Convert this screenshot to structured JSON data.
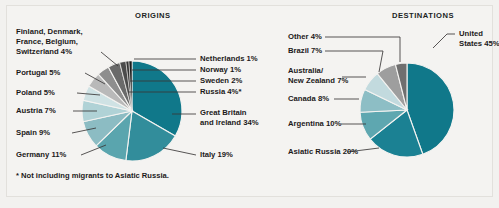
{
  "figure": {
    "background_color": "#f4f3f1",
    "footnote": "* Not including migrants to Asiatic Russia."
  },
  "panels": {
    "origins": {
      "title": "ORIGINS"
    },
    "destinations": {
      "title": "DESTINATIONS"
    }
  },
  "labels": {
    "origins": {
      "finland_group": "Finland, Denmark,",
      "finland_group_2": "France, Belgium,",
      "finland_group_3": "Switzerland  4%",
      "portugal": "Portugal  5%",
      "poland": "Poland  5%",
      "austria": "Austria  7%",
      "spain": "Spain  9%",
      "germany": "Germany  11%",
      "netherlands": "Netherlands  1%",
      "norway": "Norway  1%",
      "sweden": "Sweden  2%",
      "russia": "Russia  4%*",
      "great_britain": "Great Britain",
      "great_britain_2": "and Ireland  34%",
      "italy": "Italy  19%"
    },
    "destinations": {
      "other": "Other  4%",
      "brazil": "Brazil  7%",
      "australia": "Australia/",
      "australia_2": "New Zealand  7%",
      "canada": "Canada  8%",
      "argentina": "Argentina  10%",
      "asiatic_russia": "Asiatic Russia  20%",
      "united_states": "United",
      "united_states_2": "States 45%"
    }
  },
  "chart_data": [
    {
      "type": "pie",
      "title": "ORIGINS",
      "note": "* Not including migrants to Asiatic Russia.",
      "unit": "percent",
      "center": [
        132,
        111
      ],
      "radius": 50,
      "start_angle_deg": -90,
      "direction": "clockwise",
      "slices": [
        {
          "label": "Great Britain and Ireland",
          "value": 34,
          "color": "#10788a",
          "label_text": "Great Britain and Ireland  34%"
        },
        {
          "label": "Italy",
          "value": 19,
          "color": "#328d9b",
          "label_text": "Italy  19%"
        },
        {
          "label": "Germany",
          "value": 11,
          "color": "#5aa5ae",
          "label_text": "Germany  11%"
        },
        {
          "label": "Spain",
          "value": 9,
          "color": "#8cbcc3",
          "label_text": "Spain  9%"
        },
        {
          "label": "Austria",
          "value": 7,
          "color": "#b0d2d6",
          "label_text": "Austria  7%"
        },
        {
          "label": "Poland",
          "value": 5,
          "color": "#cfe2e4",
          "label_text": "Poland  5%"
        },
        {
          "label": "Portugal",
          "value": 5,
          "color": "#b9b9b9",
          "label_text": "Portugal  5%"
        },
        {
          "label": "Finland, Denmark, France, Belgium, Switzerland",
          "value": 4,
          "color": "#8e8e8e",
          "label_text": "Finland, Denmark, France, Belgium, Switzerland  4%"
        },
        {
          "label": "Russia",
          "value": 4,
          "color": "#6a6a6a",
          "label_text": "Russia  4%*"
        },
        {
          "label": "Sweden",
          "value": 2,
          "color": "#4b4b4b",
          "label_text": "Sweden  2%"
        },
        {
          "label": "Norway",
          "value": 1,
          "color": "#333333",
          "label_text": "Norway  1%"
        },
        {
          "label": "Netherlands",
          "value": 1,
          "color": "#1c1c1c",
          "label_text": "Netherlands  1%"
        }
      ],
      "total": 102
    },
    {
      "type": "pie",
      "title": "DESTINATIONS",
      "unit": "percent",
      "center": [
        407,
        110
      ],
      "radius": 47,
      "start_angle_deg": -90,
      "direction": "clockwise",
      "slices": [
        {
          "label": "United States",
          "value": 45,
          "color": "#10788a",
          "label_text": "United States 45%"
        },
        {
          "label": "Asiatic Russia",
          "value": 20,
          "color": "#1b8193",
          "label_text": "Asiatic Russia  20%"
        },
        {
          "label": "Argentina",
          "value": 10,
          "color": "#5ea7b0",
          "label_text": "Argentina  10%"
        },
        {
          "label": "Canada",
          "value": 8,
          "color": "#8dbec5",
          "label_text": "Canada  8%"
        },
        {
          "label": "Australia/New Zealand",
          "value": 7,
          "color": "#c2dade",
          "label_text": "Australia/ New Zealand  7%"
        },
        {
          "label": "Brazil",
          "value": 7,
          "color": "#9e9e9e",
          "label_text": "Brazil  7%"
        },
        {
          "label": "Other",
          "value": 4,
          "color": "#6f6f6f",
          "label_text": "Other  4%"
        }
      ],
      "total": 101
    }
  ]
}
